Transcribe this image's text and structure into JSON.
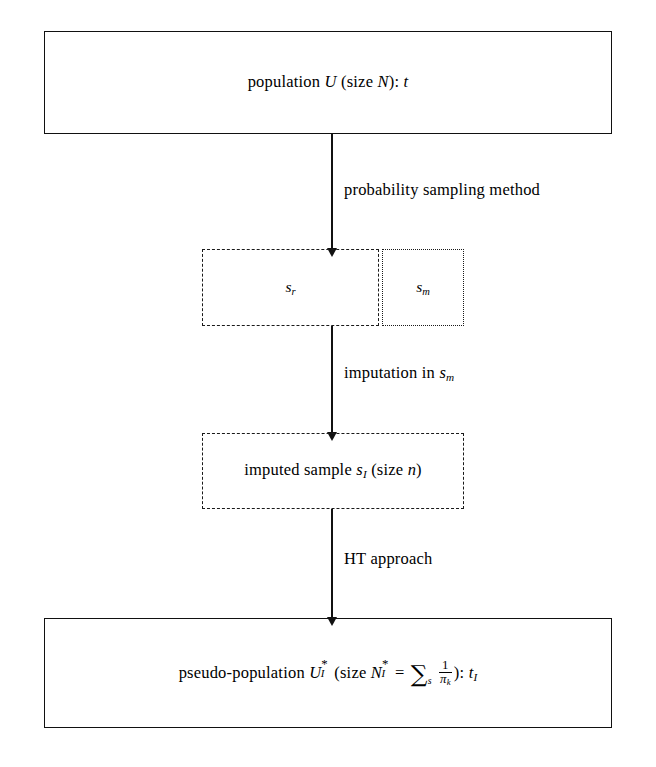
{
  "diagram": {
    "nodes": {
      "population": {
        "text_plain": "population U (size N): t",
        "label": "population",
        "symbol": "U",
        "size_prefix": "(size",
        "size_symbol": "N",
        "size_suffix": "):",
        "total": "t"
      },
      "respondents": {
        "text_plain": "s_r",
        "symbol": "s",
        "subscript": "r",
        "border_style": "dashed"
      },
      "missing": {
        "text_plain": "s_m",
        "symbol": "s",
        "subscript": "m",
        "border_style": "dotted"
      },
      "imputed_sample": {
        "text_plain": "imputed sample s_I (size n)",
        "label": "imputed sample",
        "symbol": "s",
        "subscript": "I",
        "size_prefix": "(size",
        "size_symbol": "n",
        "size_suffix": ")",
        "border_style": "dashed"
      },
      "pseudo_population": {
        "text_plain": "pseudo-population U*_I (size N*_I = ∑_s 1/π_k): t_I",
        "label": "pseudo-population",
        "symbol": "U",
        "symbol_star": "*",
        "symbol_subscript": "I",
        "size_prefix": "(size",
        "size_symbol": "N",
        "size_star": "*",
        "size_subscript": "I",
        "equals": "=",
        "sum_glyph": "∑",
        "sum_subscript": "s",
        "fraction_numerator": "1",
        "fraction_denominator": "π",
        "fraction_denominator_subscript": "k",
        "size_suffix": "):",
        "total": "t",
        "total_subscript": "I"
      }
    },
    "edges": [
      {
        "id": "edge-1",
        "label": "probability sampling method",
        "from": "population",
        "to": "sample"
      },
      {
        "id": "edge-2",
        "label_plain": "imputation in s_m",
        "label_prefix": "imputation in",
        "label_symbol": "s",
        "label_subscript": "m",
        "from": "sample",
        "to": "imputed_sample"
      },
      {
        "id": "edge-3",
        "label": "HT approach",
        "from": "imputed_sample",
        "to": "pseudo_population"
      }
    ],
    "colors": {
      "stroke": "#111111",
      "text": "#000000",
      "background": "#ffffff"
    }
  }
}
